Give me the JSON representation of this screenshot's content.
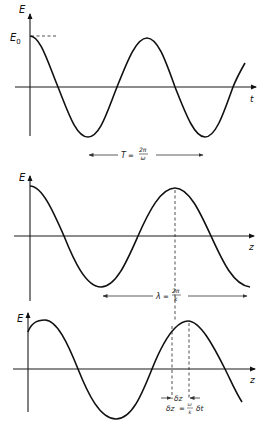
{
  "panels": [
    {
      "name": "time-domain",
      "y_label": "E",
      "x_label": "t",
      "amplitude_label": "E",
      "amplitude_sub": "0",
      "period": {
        "lhs": "T",
        "eq": "=",
        "num": "2π",
        "den": "ω"
      }
    },
    {
      "name": "space-domain",
      "y_label": "E",
      "x_label": "z",
      "wavelength": {
        "lhs": "λ",
        "eq": "=",
        "num": "2π",
        "den": "k"
      }
    },
    {
      "name": "shifted-wave",
      "y_label": "E",
      "x_label": "z",
      "shift_marker": "δz",
      "shift_eq": {
        "lhs": "δz",
        "eq": "=",
        "num": "ω",
        "den": "k",
        "rhs": "δt"
      }
    }
  ],
  "colors": {
    "ink": "#111111",
    "background": "#ffffff"
  }
}
